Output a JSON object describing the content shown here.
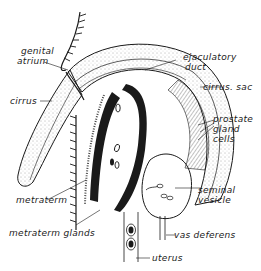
{
  "diagram": {
    "colors": {
      "ink": "#1a1a1a",
      "background": "#ffffff",
      "stipple": "#8a8a8a"
    },
    "labels": {
      "genital_atrium": "genital\natrium",
      "genital_atrium_line1": "genital",
      "genital_atrium_line2": "atrium",
      "cirrus": "cirrus",
      "ejaculatory_duct_line1": "ejaculatory",
      "ejaculatory_duct_line2": "duct",
      "cirrus_sac": "cirrus. sac",
      "prostate_line1": "prostate",
      "prostate_line2": "gland",
      "prostate_line3": "cells",
      "seminal_line1": "seminal",
      "seminal_line2": "vesicle",
      "metraterm": "metraterm",
      "metraterm_glands": "metraterm glands",
      "vas_deferens": "vas deferens",
      "uterus": "uterus"
    }
  }
}
